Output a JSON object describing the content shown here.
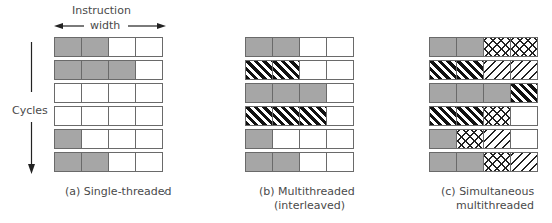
{
  "axes": {
    "horizontal_label_line1": "Instruction",
    "horizontal_label_line2": "width",
    "vertical_label": "Cycles"
  },
  "legend_patterns": {
    "G": "gray filled slot (thread A)",
    "B": "thick black diagonal stripes (thread B)",
    "X": "crosshatch (thread C)",
    "L": "thin diagonal lines (thread D)",
    "W": "empty slot"
  },
  "panels": [
    {
      "id": "a",
      "caption_line1": "(a) Single-threaded",
      "caption_line2": "",
      "rows": [
        [
          "G",
          "G",
          "W",
          "W"
        ],
        [
          "G",
          "G",
          "G",
          "W"
        ],
        [
          "W",
          "W",
          "W",
          "W"
        ],
        [
          "W",
          "W",
          "W",
          "W"
        ],
        [
          "G",
          "W",
          "W",
          "W"
        ],
        [
          "G",
          "G",
          "W",
          "W"
        ]
      ]
    },
    {
      "id": "b",
      "caption_line1": "(b) Multithreaded",
      "caption_line2": "(interleaved)",
      "rows": [
        [
          "G",
          "G",
          "W",
          "W"
        ],
        [
          "B",
          "B",
          "W",
          "W"
        ],
        [
          "G",
          "G",
          "G",
          "W"
        ],
        [
          "B",
          "B",
          "B",
          "W"
        ],
        [
          "G",
          "W",
          "W",
          "W"
        ],
        [
          "G",
          "G",
          "W",
          "W"
        ]
      ]
    },
    {
      "id": "c",
      "caption_line1": "(c) Simultaneous",
      "caption_line2": "multithreaded",
      "rows": [
        [
          "G",
          "G",
          "X",
          "X"
        ],
        [
          "B",
          "B",
          "L",
          "L"
        ],
        [
          "G",
          "G",
          "G",
          "B"
        ],
        [
          "B",
          "B",
          "X",
          "W"
        ],
        [
          "G",
          "X",
          "L",
          "W"
        ],
        [
          "G",
          "G",
          "X",
          "L"
        ]
      ]
    }
  ],
  "colors": {
    "gray_fill": "#a6a6a6",
    "border": "#6a6a6a",
    "stripe": "#111111",
    "text": "#4a4a4a"
  }
}
